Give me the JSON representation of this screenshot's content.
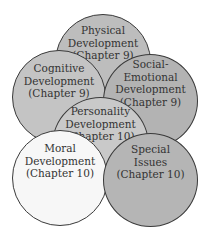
{
  "diagram": {
    "type": "overlapping-circles",
    "circles": [
      {
        "id": "physical",
        "lines": [
          "Physical",
          "Development",
          "(Chapter 9)"
        ],
        "fill": "#bdbdbd"
      },
      {
        "id": "cognitive",
        "lines": [
          "Cognitive",
          "Development",
          "(Chapter 9)"
        ],
        "fill": "#c4c4c4"
      },
      {
        "id": "social-emotional",
        "lines": [
          "Social-",
          "Emotional",
          "Development",
          "(Chapter 9)"
        ],
        "fill": "#b3b3b3"
      },
      {
        "id": "personality",
        "lines": [
          "Personality",
          "Development",
          "(Chapter 10)"
        ],
        "fill": "#c9c9c9"
      },
      {
        "id": "moral",
        "lines": [
          "Moral",
          "Development",
          "(Chapter 10)"
        ],
        "fill": "#f7f7f7"
      },
      {
        "id": "special",
        "lines": [
          "Special",
          "Issues",
          "(Chapter 10)"
        ],
        "fill": "#b5b5b5"
      }
    ],
    "outline_color": "#3a3a3a",
    "text_color": "#333333"
  }
}
